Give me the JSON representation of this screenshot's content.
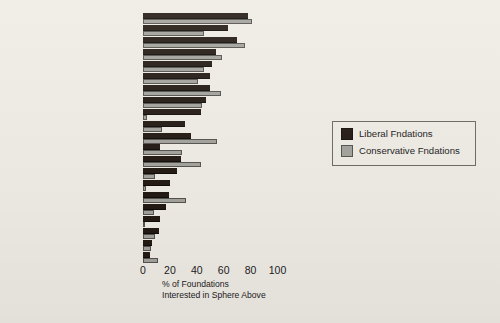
{
  "chart_data": {
    "type": "bar",
    "title": "",
    "orientation": "horizontal",
    "xlabel_lines": [
      "% of Foundations",
      "Interested in Sphere Above"
    ],
    "ylabel": "",
    "xlim": [
      0,
      100
    ],
    "xticks": [
      0,
      20,
      40,
      60,
      80,
      100
    ],
    "grid": false,
    "legend_position": "right",
    "categories": [
      "Civics",
      "Community",
      "International Relation",
      "Law",
      "Education",
      "Environment",
      "Economics",
      "Health/Science",
      "Minorities",
      "Journalism",
      "Think-tanks",
      "Family & Population",
      "War & Peace",
      "Arts",
      "Women",
      "Philosophy & Religion",
      "Immigration",
      "Agriculture",
      "Aging",
      "South Africa",
      "Human Rights"
    ],
    "series": [
      {
        "name": "Liberal Fndations",
        "color": "#241a14",
        "values": [
          78,
          63,
          70,
          54,
          51,
          50,
          50,
          47,
          43,
          31,
          36,
          13,
          28,
          25,
          20,
          19,
          17,
          13,
          12,
          7,
          5
        ]
      },
      {
        "name": "Conservative Fndations",
        "color": "#a3a29c",
        "values": [
          81,
          45,
          76,
          59,
          45,
          41,
          58,
          44,
          3,
          14,
          55,
          29,
          43,
          9,
          2,
          32,
          8,
          1,
          9,
          6,
          11
        ]
      }
    ]
  },
  "legend": {
    "items": [
      {
        "label": "Liberal Fndations",
        "swatch": "dark-swatch"
      },
      {
        "label": "Conservative Fndations",
        "swatch": "light-swatch"
      }
    ]
  },
  "axis": {
    "tick_labels": [
      "0",
      "20",
      "40",
      "60",
      "80",
      "100"
    ],
    "title_line1": "% of Foundations",
    "title_line2": "Interested in Sphere Above"
  }
}
